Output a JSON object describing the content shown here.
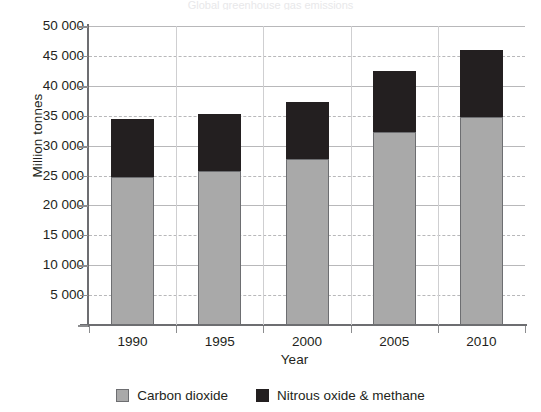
{
  "cropped_header_text": "Global greenhouse gas emissions",
  "chart_data": {
    "type": "bar",
    "subtype": "stacked-vertical",
    "title": "",
    "xlabel": "Year",
    "ylabel": "Million tonnes",
    "categories": [
      "1990",
      "1995",
      "2000",
      "2005",
      "2010"
    ],
    "series": [
      {
        "name": "Carbon dioxide",
        "color": "#a9a9a9",
        "values": [
          24800,
          25800,
          27800,
          32200,
          34800
        ]
      },
      {
        "name": "Nitrous oxide & methane",
        "color": "#231f20",
        "values": [
          9700,
          9500,
          9500,
          10300,
          11200
        ]
      }
    ],
    "totals": [
      34500,
      35300,
      37300,
      42500,
      46000
    ],
    "ylim": [
      0,
      50000
    ],
    "ytick_values": [
      0,
      5000,
      10000,
      15000,
      20000,
      25000,
      30000,
      35000,
      40000,
      45000,
      50000
    ],
    "ytick_labels": [
      "",
      "5 000",
      "10 000",
      "15 000",
      "20 000",
      "25 000",
      "30 000",
      "35 000",
      "40 000",
      "45 000",
      "50 000"
    ],
    "gridline_styles": [
      "solid",
      "dashed",
      "solid",
      "dashed",
      "solid",
      "dashed",
      "solid",
      "dashed",
      "solid",
      "dashed",
      "solid"
    ],
    "grid": true,
    "legend_position": "bottom",
    "legend": [
      "Carbon dioxide",
      "Nitrous oxide & methane"
    ]
  }
}
